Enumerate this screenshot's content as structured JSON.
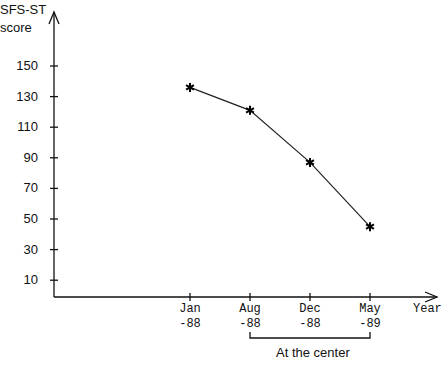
{
  "chart_data": {
    "type": "line",
    "title": "",
    "ylabel": "SFS-ST score",
    "ylabel_line1": "SFS-ST",
    "ylabel_line2": "score",
    "xlabel": "Year",
    "y_ticks": [
      10,
      30,
      50,
      70,
      90,
      110,
      130,
      150
    ],
    "ylim": [
      0,
      170
    ],
    "categories": [
      "Jan -88",
      "Aug -88",
      "Dec -88",
      "May -89"
    ],
    "category_lines": [
      [
        "Jan",
        "-88"
      ],
      [
        "Aug",
        "-88"
      ],
      [
        "Dec",
        "-88"
      ],
      [
        "May",
        "-89"
      ]
    ],
    "series": [
      {
        "name": "SFS-ST score",
        "marker": "asterisk",
        "values": [
          136,
          121,
          87,
          45
        ]
      }
    ],
    "annotations": [
      {
        "text": "At the center",
        "type": "bracket",
        "from": "Aug -88",
        "to": "May -89"
      }
    ],
    "grid": false,
    "legend": null
  }
}
